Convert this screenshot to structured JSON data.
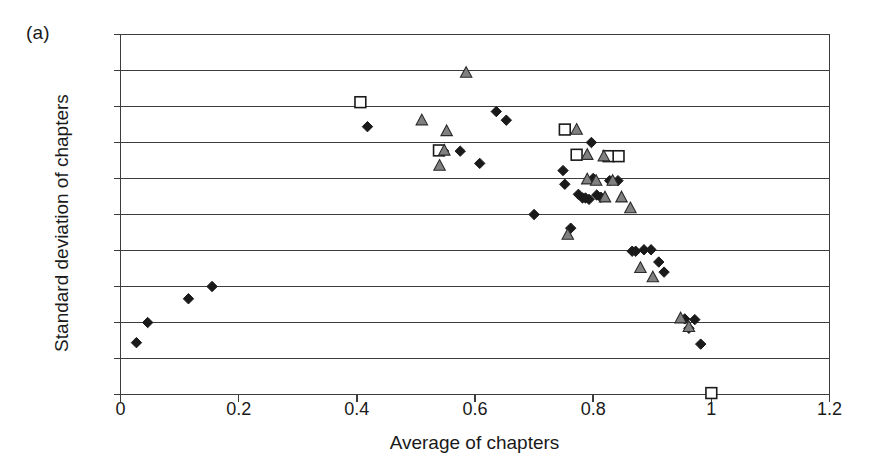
{
  "figure": {
    "panel_label": "(a)",
    "xlabel": "Average of chapters",
    "ylabel": "Standard deviation of chapters"
  },
  "chart_data": {
    "type": "scatter",
    "title": "",
    "panel": "(a)",
    "xlabel": "Average of chapters",
    "ylabel": "Standard deviation of chapters",
    "xlim": [
      0,
      1.2
    ],
    "ylim": [
      0,
      0.5
    ],
    "xticks": [
      "0",
      "0.2",
      "0.4",
      "0.6",
      "0.8",
      "1",
      "1.2"
    ],
    "xtick_values": [
      0,
      0.2,
      0.4,
      0.6,
      0.8,
      1.0,
      1.2
    ],
    "yticks": [
      "0",
      "0.05",
      "0.1",
      "0.15",
      "0.2",
      "0.25",
      "0.3",
      "0.35",
      "0.4",
      "0.45",
      "0.5"
    ],
    "ytick_values": [
      0,
      0.05,
      0.1,
      0.15,
      0.2,
      0.25,
      0.3,
      0.35,
      0.4,
      0.45,
      0.5
    ],
    "grid": "horizontal",
    "legend": "none",
    "series": [
      {
        "name": "diamond",
        "marker": "filled-diamond",
        "color": "#1a1a1a",
        "points": [
          [
            0.027,
            0.072
          ],
          [
            0.046,
            0.1
          ],
          [
            0.115,
            0.133
          ],
          [
            0.155,
            0.15
          ],
          [
            0.418,
            0.372
          ],
          [
            0.547,
            0.338
          ],
          [
            0.575,
            0.338
          ],
          [
            0.608,
            0.321
          ],
          [
            0.636,
            0.393
          ],
          [
            0.653,
            0.381
          ],
          [
            0.7,
            0.25
          ],
          [
            0.749,
            0.311
          ],
          [
            0.752,
            0.292
          ],
          [
            0.762,
            0.231
          ],
          [
            0.775,
            0.278
          ],
          [
            0.782,
            0.273
          ],
          [
            0.787,
            0.273
          ],
          [
            0.793,
            0.271
          ],
          [
            0.797,
            0.35
          ],
          [
            0.8,
            0.3
          ],
          [
            0.806,
            0.277
          ],
          [
            0.813,
            0.274
          ],
          [
            0.828,
            0.297
          ],
          [
            0.842,
            0.297
          ],
          [
            0.866,
            0.199
          ],
          [
            0.872,
            0.199
          ],
          [
            0.886,
            0.201
          ],
          [
            0.898,
            0.201
          ],
          [
            0.911,
            0.184
          ],
          [
            0.92,
            0.17
          ],
          [
            0.955,
            0.105
          ],
          [
            0.962,
            0.092
          ],
          [
            0.972,
            0.104
          ],
          [
            0.982,
            0.07
          ]
        ]
      },
      {
        "name": "square",
        "marker": "open-square",
        "color": "#1a1a1a",
        "points": [
          [
            0.406,
            0.406
          ],
          [
            0.539,
            0.339
          ],
          [
            0.752,
            0.368
          ],
          [
            0.772,
            0.333
          ],
          [
            0.826,
            0.331
          ],
          [
            0.843,
            0.331
          ],
          [
            1.0,
            0.002
          ]
        ]
      },
      {
        "name": "triangle",
        "marker": "filled-triangle",
        "color": "#808080",
        "points": [
          [
            0.51,
            0.381
          ],
          [
            0.54,
            0.318
          ],
          [
            0.548,
            0.339
          ],
          [
            0.552,
            0.366
          ],
          [
            0.585,
            0.447
          ],
          [
            0.772,
            0.368
          ],
          [
            0.79,
            0.333
          ],
          [
            0.818,
            0.331
          ],
          [
            0.79,
            0.299
          ],
          [
            0.805,
            0.297
          ],
          [
            0.833,
            0.297
          ],
          [
            0.82,
            0.274
          ],
          [
            0.848,
            0.274
          ],
          [
            0.757,
            0.222
          ],
          [
            0.863,
            0.259
          ],
          [
            0.88,
            0.176
          ],
          [
            0.901,
            0.163
          ],
          [
            0.948,
            0.106
          ],
          [
            0.962,
            0.094
          ]
        ]
      }
    ]
  }
}
